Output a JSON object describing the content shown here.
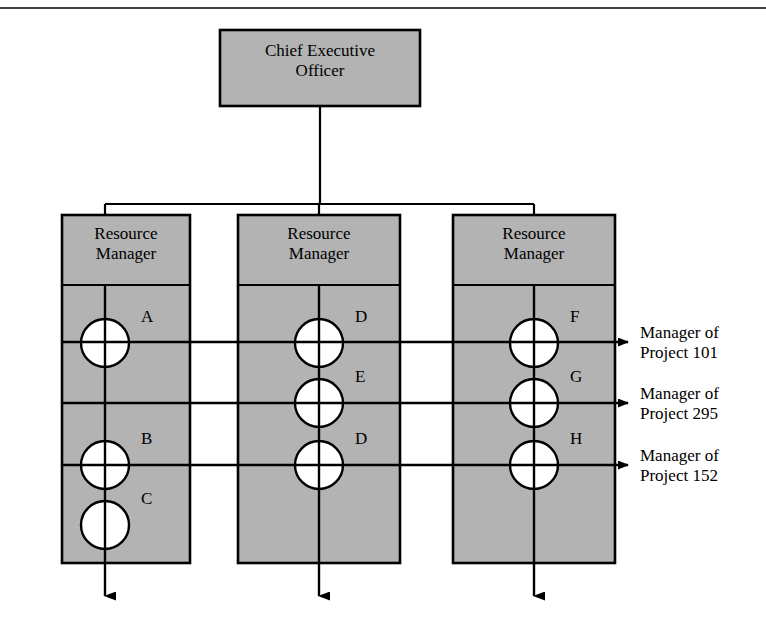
{
  "diagram": {
    "type": "matrix-organization-chart",
    "colors": {
      "box_fill": "#b3b3b3",
      "stroke": "#000000",
      "circle_fill": "#ffffff",
      "background": "#ffffff"
    },
    "top_rule": {
      "visible": true
    },
    "ceo": {
      "label_line1": "Chief Executive",
      "label_line2": "Officer",
      "x": 220,
      "y": 30,
      "w": 200,
      "h": 76
    },
    "columns": [
      {
        "id": "rm1",
        "header_line1": "Resource",
        "header_line2": "Manager",
        "x": 62,
        "y": 215,
        "w": 128,
        "h": 348,
        "header_h": 70,
        "spine_x": 105,
        "resources": [
          {
            "label": "A",
            "cy": 343,
            "r": 24,
            "on_project_line": 1
          },
          {
            "label": "B",
            "cy": 465,
            "r": 24,
            "on_project_line": 3
          },
          {
            "label": "C",
            "cy": 525,
            "r": 24,
            "on_project_line": 0
          }
        ]
      },
      {
        "id": "rm2",
        "header_line1": "Resource",
        "header_line2": "Manager",
        "x": 238,
        "y": 215,
        "w": 162,
        "h": 348,
        "header_h": 70,
        "spine_x": 319,
        "resources": [
          {
            "label": "D",
            "cy": 343,
            "r": 24,
            "on_project_line": 1
          },
          {
            "label": "E",
            "cy": 403,
            "r": 24,
            "on_project_line": 2
          },
          {
            "label": "D",
            "cy": 465,
            "r": 24,
            "on_project_line": 3
          }
        ]
      },
      {
        "id": "rm3",
        "header_line1": "Resource",
        "header_line2": "Manager",
        "x": 453,
        "y": 215,
        "w": 162,
        "h": 348,
        "header_h": 70,
        "spine_x": 534,
        "resources": [
          {
            "label": "F",
            "cy": 343,
            "r": 24,
            "on_project_line": 1
          },
          {
            "label": "G",
            "cy": 403,
            "r": 24,
            "on_project_line": 2
          },
          {
            "label": "H",
            "cy": 465,
            "r": 24,
            "on_project_line": 3
          }
        ]
      }
    ],
    "project_lines": [
      {
        "id": "p101",
        "y": 342,
        "label_line1": "Manager of",
        "label_line2": "Project 101",
        "label_x": 640
      },
      {
        "id": "p295",
        "y": 403,
        "label_line1": "Manager of",
        "label_line2": "Project 295",
        "label_x": 640
      },
      {
        "id": "p152",
        "y": 465,
        "label_line1": "Manager of",
        "label_line2": "Project 152",
        "label_x": 640
      }
    ],
    "connector": {
      "bar_y": 204,
      "stem_top": 106,
      "stem_x": 320
    },
    "down_arrows": {
      "from_y": 563,
      "to_y": 596
    }
  }
}
